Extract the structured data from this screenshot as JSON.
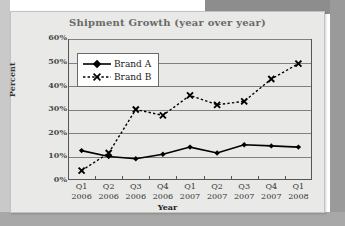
{
  "chart_data": {
    "type": "line",
    "title": "Shipment Growth (year over year)",
    "xlabel": "Year",
    "ylabel": "Percent",
    "categories": [
      "Q1 2006",
      "Q2 2006",
      "Q3 2006",
      "Q4 2006",
      "Q1 2007",
      "Q2 2007",
      "Q3 2007",
      "Q4 2007",
      "Q1 2008"
    ],
    "category_lines": [
      {
        "quarter": "Q1",
        "year": "2006"
      },
      {
        "quarter": "Q2",
        "year": "2006"
      },
      {
        "quarter": "Q3",
        "year": "2006"
      },
      {
        "quarter": "Q4",
        "year": "2006"
      },
      {
        "quarter": "Q1",
        "year": "2007"
      },
      {
        "quarter": "Q2",
        "year": "2007"
      },
      {
        "quarter": "Q3",
        "year": "2007"
      },
      {
        "quarter": "Q4",
        "year": "2007"
      },
      {
        "quarter": "Q1",
        "year": "2008"
      }
    ],
    "series": [
      {
        "name": "Brand A",
        "values": [
          12.5,
          10.0,
          9.0,
          11.0,
          14.0,
          11.5,
          15.0,
          14.5,
          14.0
        ],
        "style": "solid",
        "marker": "diamond",
        "color": "#000000"
      },
      {
        "name": "Brand B",
        "values": [
          4.0,
          11.5,
          30.0,
          27.5,
          36.0,
          32.0,
          33.5,
          43.0,
          49.5
        ],
        "style": "dotted",
        "marker": "x",
        "color": "#000000"
      }
    ],
    "ylim": [
      0,
      60
    ],
    "yticks": [
      0,
      10,
      20,
      30,
      40,
      50,
      60
    ],
    "ytick_labels": [
      "0%",
      "10%",
      "20%",
      "30%",
      "40%",
      "50%",
      "60%"
    ],
    "grid": "horizontal",
    "legend_position": "top-left-inside"
  },
  "colors": {
    "card_background": "#e9e9e7",
    "outer_background": "#9a9a9a",
    "title_text": "#6a6a6a",
    "gridline": "#808080",
    "axis": "#555555",
    "series": "#000000"
  }
}
